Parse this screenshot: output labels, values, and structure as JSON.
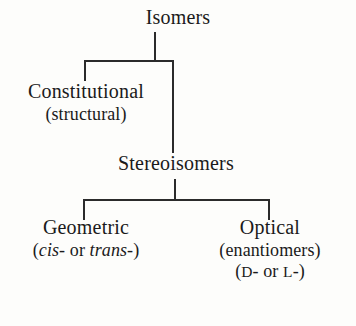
{
  "diagram": {
    "type": "classification-tree",
    "title_node": "Isomers",
    "nodes": {
      "isomers": {
        "label": "Isomers"
      },
      "constitutional": {
        "label": "Constitutional",
        "sub": "(structural)"
      },
      "stereoisomers": {
        "label": "Stereoisomers"
      },
      "geometric": {
        "label": "Geometric",
        "sub_open": "(",
        "sub_ital1": "cis",
        "sub_mid": "- or ",
        "sub_ital2": "trans",
        "sub_close": "-)"
      },
      "optical": {
        "label": "Optical",
        "sub": "(enantiomers)",
        "sub2_open": "(",
        "sub2_d": "D",
        "sub2_mid": "- or ",
        "sub2_l": "L",
        "sub2_close": "-)"
      }
    },
    "colors": {
      "background": "#fdfdfb",
      "text": "#1a1a1a",
      "line": "#2b2b2b"
    }
  }
}
